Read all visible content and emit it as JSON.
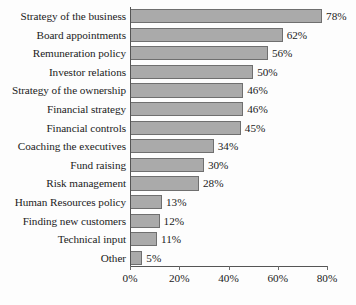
{
  "chart_data": {
    "type": "bar",
    "orientation": "horizontal",
    "title": "",
    "xlabel": "",
    "ylabel": "",
    "xlim": [
      0,
      80
    ],
    "grid": false,
    "legend": null,
    "bar_color": "#aaaaaa",
    "bar_border_color": "#6f6f6f",
    "value_suffix": "%",
    "categories": [
      "Strategy of the business",
      "Board appointments",
      "Remuneration policy",
      "Investor relations",
      "Strategy of the ownership",
      "Financial strategy",
      "Financial controls",
      "Coaching the executives",
      "Fund raising",
      "Risk management",
      "Human Resources policy",
      "Finding new customers",
      "Technical input",
      "Other"
    ],
    "values": [
      78,
      62,
      56,
      50,
      46,
      46,
      45,
      34,
      30,
      28,
      13,
      12,
      11,
      5
    ],
    "value_labels": [
      "78%",
      "62%",
      "56%",
      "50%",
      "46%",
      "46%",
      "45%",
      "34%",
      "30%",
      "28%",
      "13%",
      "12%",
      "11%",
      "5%"
    ],
    "xticks": [
      0,
      20,
      40,
      60,
      80
    ],
    "xtick_labels": [
      "0%",
      "20%",
      "40%",
      "60%",
      "80%"
    ]
  }
}
